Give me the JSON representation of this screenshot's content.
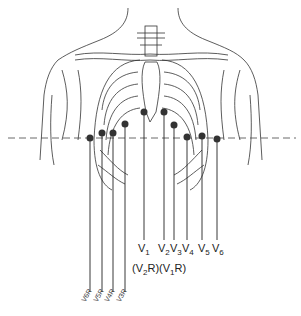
{
  "diagram": {
    "line_color": "#222222",
    "electrode_color": "#333333",
    "labels_left_leads": [
      {
        "id": "V1",
        "text": "V",
        "sub": "1"
      },
      {
        "id": "V2",
        "text": "V",
        "sub": "2"
      },
      {
        "id": "V3",
        "text": "V",
        "sub": "3"
      },
      {
        "id": "V4",
        "text": "V",
        "sub": "4"
      },
      {
        "id": "V5",
        "text": "V",
        "sub": "5"
      },
      {
        "id": "V6",
        "text": "V",
        "sub": "6"
      }
    ],
    "labels_right_alt": [
      {
        "id": "V2R",
        "text": "(V",
        "sub": "2",
        "suffix": "R)"
      },
      {
        "id": "V1R",
        "text": "(V",
        "sub": "1",
        "suffix": "R)"
      }
    ],
    "labels_right_leads_rotated": [
      "V6R",
      "V5R",
      "V4R",
      "V3R"
    ],
    "reference_line": "dashed horizontal line at electrode level"
  }
}
